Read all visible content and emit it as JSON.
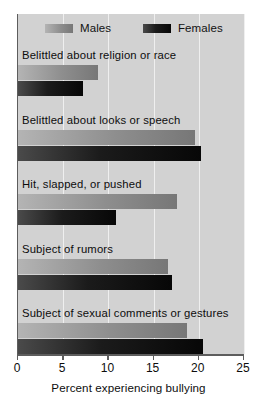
{
  "chart_data": {
    "type": "bar",
    "orientation": "horizontal",
    "title": "",
    "xlabel": "Percent experiencing bullying",
    "ylabel": "",
    "xlim": [
      0,
      25
    ],
    "xticks": [
      0,
      5,
      10,
      15,
      20,
      25
    ],
    "grid": true,
    "legend_position": "top",
    "categories": [
      "Belittled about religion or race",
      "Belittled about looks or speech",
      "Hit, slapped, or pushed",
      "Subject of rumors",
      "Subject of sexual comments or gestures"
    ],
    "series": [
      {
        "name": "Males",
        "color": "#8e8e8e",
        "values": [
          8.8,
          19.6,
          17.6,
          16.6,
          18.7
        ]
      },
      {
        "name": "Females",
        "color": "#1b1b1b",
        "values": [
          7.2,
          20.2,
          10.8,
          17.0,
          20.5
        ]
      }
    ]
  },
  "legend": {
    "males_label": "Males",
    "females_label": "Females"
  },
  "axis": {
    "tick_labels": [
      "0",
      "5",
      "10",
      "15",
      "20",
      "25"
    ],
    "x_title": "Percent experiencing bullying"
  }
}
